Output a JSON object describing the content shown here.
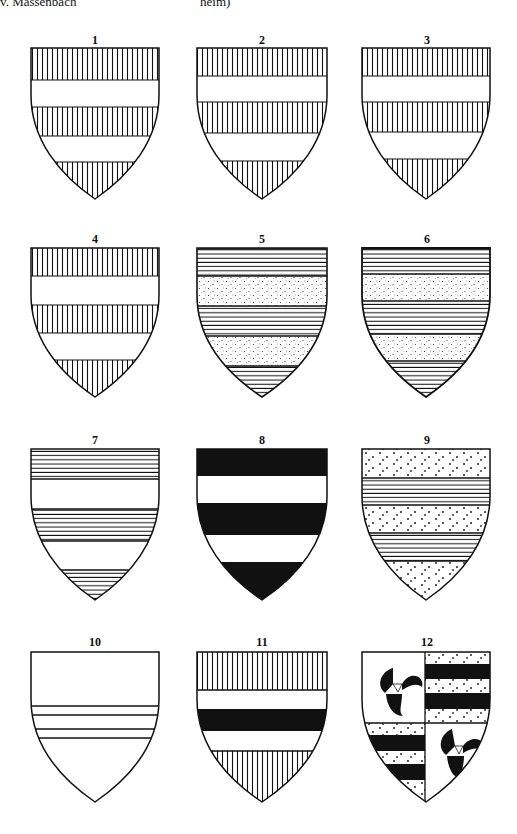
{
  "header": {
    "left_text": "v. Massenbach",
    "mid_text": "heim)"
  },
  "colors": {
    "ink": "#111111",
    "paper": "#ffffff"
  },
  "shields": [
    {
      "label": "1",
      "description": "Vertical hatching with two plain fesses"
    },
    {
      "label": "2",
      "description": "Vertical hatching with two plain fesses"
    },
    {
      "label": "3",
      "description": "Vertical hatching with two plain fesses"
    },
    {
      "label": "4",
      "description": "Vertical hatching with two plain fesses"
    },
    {
      "label": "5",
      "description": "Horizontal hatching with two stippled fesses"
    },
    {
      "label": "6",
      "description": "Horizontal hatching with two stippled fesses"
    },
    {
      "label": "7",
      "description": "Horizontal hatching bands alternating with plain"
    },
    {
      "label": "8",
      "description": "Black with two white fesses"
    },
    {
      "label": "9",
      "description": "Stippled with two horizontally hatched fesses"
    },
    {
      "label": "10",
      "description": "Plain with two narrow bars"
    },
    {
      "label": "11",
      "description": "Vertical hatching chief and base, white, black fess"
    },
    {
      "label": "12",
      "description": "Quarterly: triskeles and barry black/stippled"
    }
  ]
}
